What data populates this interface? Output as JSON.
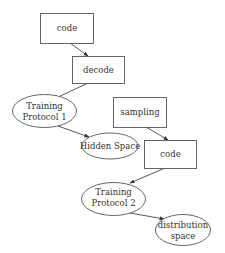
{
  "diagram": {
    "type": "flowchart",
    "nodes": [
      {
        "id": "code1",
        "shape": "rect",
        "label": "code"
      },
      {
        "id": "decode",
        "shape": "rect",
        "label": "decode"
      },
      {
        "id": "tp1",
        "shape": "ellipse",
        "label_line1": "Training",
        "label_line2": "Protocol 1"
      },
      {
        "id": "hidden",
        "shape": "ellipse",
        "label": "Hidden Space"
      },
      {
        "id": "sampling",
        "shape": "rect",
        "label": "sampling"
      },
      {
        "id": "code2",
        "shape": "rect",
        "label": "code"
      },
      {
        "id": "tp2",
        "shape": "ellipse",
        "label_line1": "Training",
        "label_line2": "Protocol 2"
      },
      {
        "id": "dist",
        "shape": "ellipse",
        "label_line1": "distribution",
        "label_line2": "space"
      }
    ],
    "edges": [
      {
        "from": "code1",
        "to": "decode"
      },
      {
        "from": "decode",
        "to": "tp1"
      },
      {
        "from": "tp1",
        "to": "hidden"
      },
      {
        "from": "sampling",
        "to": "code2"
      },
      {
        "from": "code2",
        "to": "tp2"
      },
      {
        "from": "tp2",
        "to": "dist"
      }
    ]
  }
}
